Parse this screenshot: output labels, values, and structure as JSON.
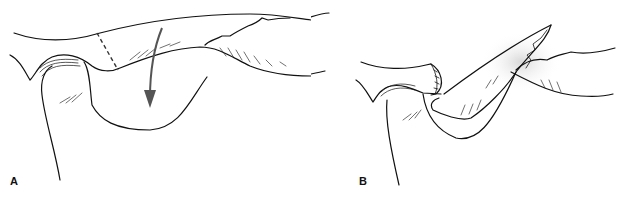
{
  "figure": {
    "panels": [
      {
        "id": "A",
        "label": "A",
        "description": "Joint with dashed incision line and downward arrow indicating displacement"
      },
      {
        "id": "B",
        "label": "B",
        "description": "Flap rotated downward into the joint space with sutured end"
      }
    ]
  },
  "colors": {
    "line": "#111111",
    "arrow": "#555555",
    "background": "#ffffff"
  }
}
